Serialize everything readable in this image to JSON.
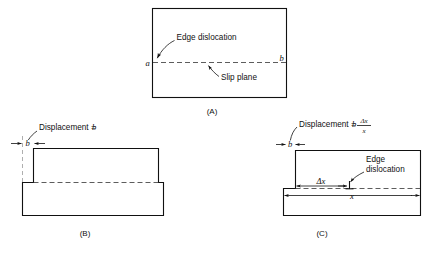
{
  "figure": {
    "background": "#ffffff",
    "ink": "#111111"
  },
  "panel_a": {
    "caption": "(A)",
    "edge_dislocation_label": "Edge dislocation",
    "slip_plane_label": "Slip plane",
    "point_left": "a",
    "point_right": "b"
  },
  "panel_b": {
    "caption": "(B)",
    "displacement_label": "Displacement =",
    "displacement_symbol": "b",
    "offset_symbol": "b"
  },
  "panel_c": {
    "caption": "(C)",
    "displacement_label": "Displacement =",
    "displacement_symbol": "b",
    "fraction_numerator": "Δx",
    "fraction_denominator": "x",
    "offset_symbol": "b",
    "edge_dislocation_label_line1": "Edge",
    "edge_dislocation_label_line2": "dislocation",
    "delta_x_label": "Δx",
    "x_label": "x",
    "dislocation_symbol": "⊥"
  }
}
